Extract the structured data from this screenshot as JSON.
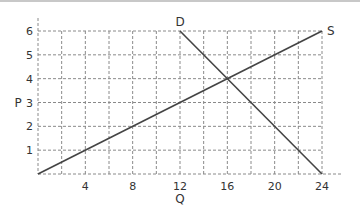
{
  "chart_data": {
    "type": "line",
    "title": "",
    "xlabel": "Q",
    "ylabel": "P",
    "xlim": [
      0,
      24
    ],
    "ylim": [
      0,
      6
    ],
    "grid": true,
    "grid_style": "dashed",
    "x_grid_step": 2,
    "y_grid_step": 1,
    "x_ticks": [
      4,
      8,
      12,
      16,
      20,
      24
    ],
    "x_tick_labels": [
      "4",
      "8",
      "12",
      "16",
      "20",
      "24"
    ],
    "y_ticks": [
      1,
      2,
      3,
      4,
      5,
      6
    ],
    "y_tick_labels": [
      "1",
      "2",
      "3",
      "4",
      "5",
      "6"
    ],
    "series": [
      {
        "name": "S",
        "label": "S",
        "x": [
          0,
          24
        ],
        "y": [
          0,
          6
        ]
      },
      {
        "name": "D",
        "label": "D",
        "x": [
          12,
          24
        ],
        "y": [
          6,
          0
        ]
      }
    ],
    "annotations": [
      {
        "text": "S",
        "at": [
          24,
          6
        ]
      },
      {
        "text": "D",
        "at": [
          12,
          6
        ]
      }
    ],
    "equilibrium": {
      "Q": 16,
      "P": 4
    },
    "legend": "none"
  },
  "colors": {
    "curve": "#444444",
    "grid": "#8a8a8a",
    "text": "#333333"
  }
}
